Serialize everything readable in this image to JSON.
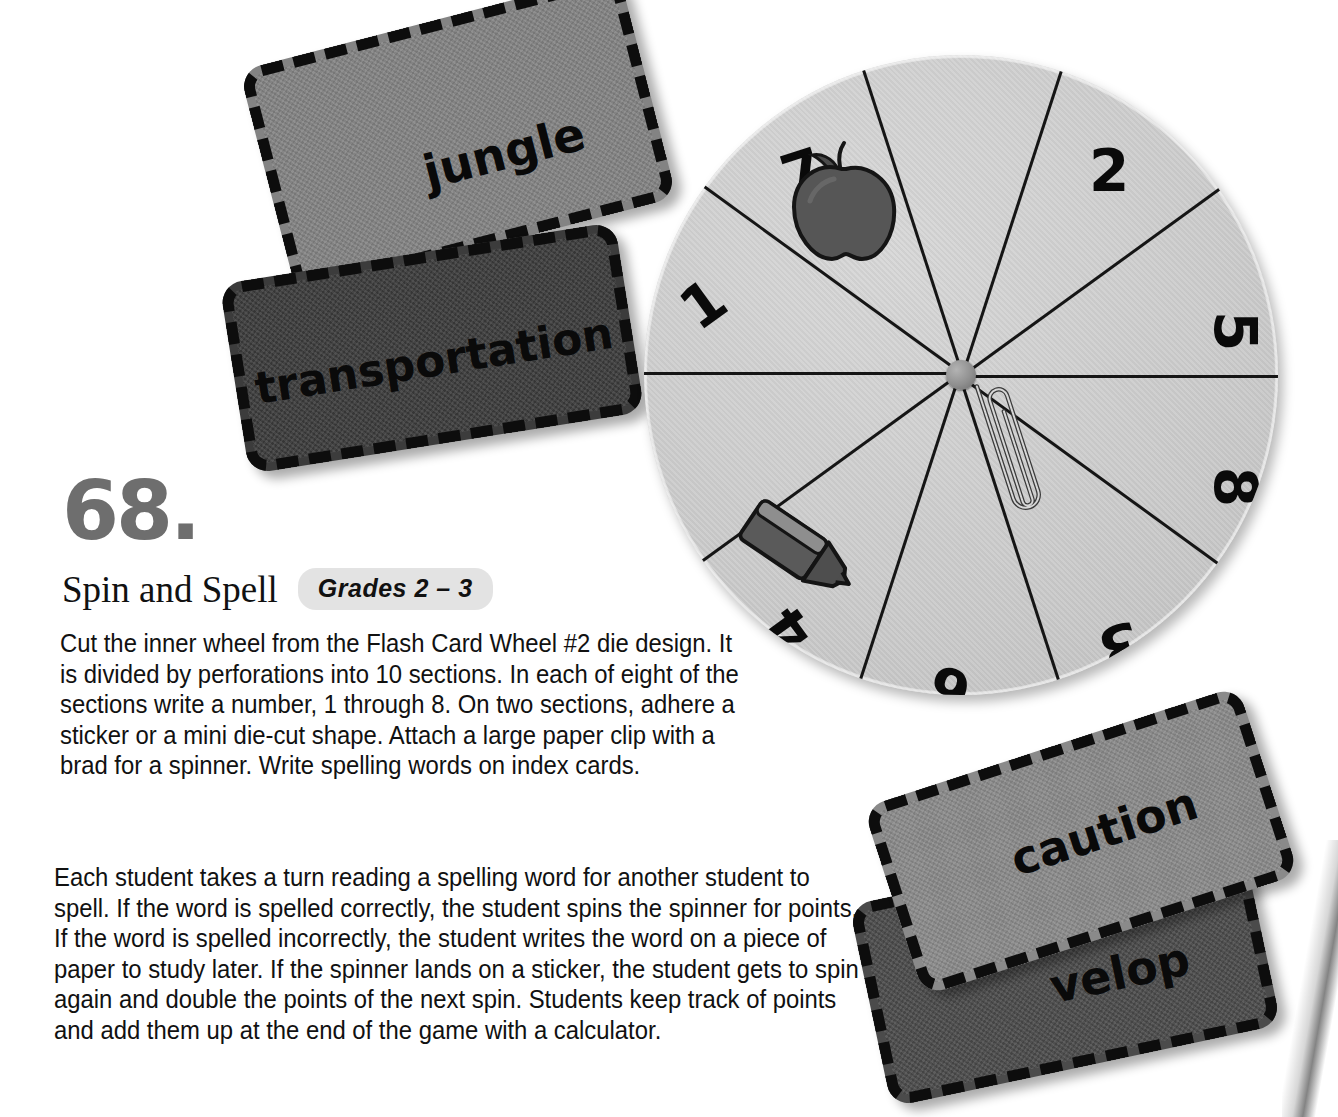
{
  "page": {
    "background_color": "#ffffff",
    "activity_number": "68.",
    "activity_number_color": "#6e6e6e"
  },
  "header": {
    "title": "Spin and Spell",
    "grades_badge": "Grades 2 – 3",
    "badge_bg_color": "#e3e3e3"
  },
  "body": {
    "paragraph_1": "Cut the inner wheel from the Flash Card Wheel #2 die design. It is divided by perforations into 10 sections. In each of eight of the sections write a number, 1 through 8. On two sections, adhere a sticker or a mini die-cut shape. Attach a large paper clip with a brad for a spinner. Write spelling words on index cards.",
    "paragraph_2": "Each student takes a turn reading a spelling word for another student to spell. If the word is spelled correctly, the student spins the spinner for points. If the word is spelled incorrectly, the student writes the word on a piece of paper to study later. If the spinner lands on a sticker, the student gets to spin again and double the points of the next spin. Students keep track of points and add them up at the end of the game with a calculator."
  },
  "flash_cards": [
    {
      "id": "jungle",
      "word": "jungle",
      "fill_color": "#838383",
      "rotation_deg": -14.5
    },
    {
      "id": "transportation",
      "word": "transportation",
      "fill_color": "#3c3c3c",
      "rotation_deg": -9
    },
    {
      "id": "caution",
      "word": "caution",
      "fill_color": "#8a8a8a",
      "rotation_deg": -18
    },
    {
      "id": "envelope",
      "word": "velop",
      "fill_color": "#4b4b4b",
      "rotation_deg": -12
    }
  ],
  "spinner_wheel": {
    "face_color": "#cdcdcd",
    "section_count": 10,
    "segments": [
      {
        "label": "2",
        "kind": "number",
        "angle_deg": -54
      },
      {
        "label": "5",
        "kind": "number",
        "angle_deg": -18
      },
      {
        "label": "8",
        "kind": "number",
        "angle_deg": 18
      },
      {
        "label": "3",
        "kind": "number",
        "angle_deg": 54
      },
      {
        "label": "6",
        "kind": "number",
        "angle_deg": 90
      },
      {
        "label": "4",
        "kind": "number",
        "angle_deg": 126
      },
      {
        "label": "",
        "kind": "sticker",
        "sticker": "crayon-sticker",
        "angle_deg": 162
      },
      {
        "label": "1",
        "kind": "number",
        "angle_deg": -162
      },
      {
        "label": "7",
        "kind": "number",
        "angle_deg": -126
      },
      {
        "label": "",
        "kind": "sticker",
        "sticker": "apple-sticker",
        "angle_deg": -90
      }
    ],
    "spoke_angles_deg": [
      -72,
      -36,
      0,
      36,
      72,
      108,
      144,
      180,
      -144,
      -108
    ],
    "spinner": {
      "type": "paper-clip",
      "pivot": "brad",
      "pointing_angle_deg": -18
    }
  }
}
